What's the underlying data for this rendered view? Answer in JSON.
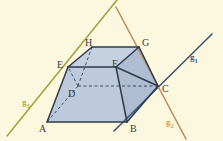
{
  "figure": {
    "name": "geometry-prism-with-three-lines",
    "background_color": "#FBF8DF",
    "width": 223,
    "height": 141
  },
  "solid": {
    "name": "truncated-prism",
    "fill_color": "#BCCADC",
    "edge_color": "#2F3B4C",
    "hidden_edge_color": "#3A4A66",
    "vertices": [
      {
        "id": "A",
        "label": "A",
        "x": 47,
        "y": 122,
        "hidden": false,
        "label_x": 39,
        "label_y": 124
      },
      {
        "id": "B",
        "label": "B",
        "x": 127,
        "y": 122,
        "hidden": false,
        "label_x": 130,
        "label_y": 124
      },
      {
        "id": "C",
        "label": "C",
        "x": 158,
        "y": 86,
        "hidden": false,
        "label_x": 162,
        "label_y": 84
      },
      {
        "id": "D",
        "label": "D",
        "x": 78,
        "y": 86,
        "hidden": true,
        "label_x": 68,
        "label_y": 89
      },
      {
        "id": "E",
        "label": "E",
        "x": 68,
        "y": 67,
        "hidden": false,
        "label_x": 57,
        "label_y": 60
      },
      {
        "id": "F",
        "label": "F",
        "x": 116,
        "y": 67,
        "hidden": false,
        "label_x": 112,
        "label_y": 59
      },
      {
        "id": "G",
        "label": "G",
        "x": 139,
        "y": 47,
        "hidden": false,
        "label_x": 142,
        "label_y": 38
      },
      {
        "id": "H",
        "label": "H",
        "x": 92,
        "y": 47,
        "hidden": false,
        "label_x": 85,
        "label_y": 38
      }
    ],
    "visible_edges": [
      [
        "A",
        "B"
      ],
      [
        "B",
        "C"
      ],
      [
        "C",
        "G"
      ],
      [
        "G",
        "H"
      ],
      [
        "H",
        "E"
      ],
      [
        "E",
        "A"
      ],
      [
        "E",
        "F"
      ],
      [
        "F",
        "G"
      ],
      [
        "F",
        "C"
      ],
      [
        "F",
        "B"
      ]
    ],
    "hidden_edges": [
      [
        "D",
        "A"
      ],
      [
        "D",
        "C"
      ],
      [
        "D",
        "H"
      ],
      [
        "D",
        "E"
      ]
    ]
  },
  "lines": [
    {
      "id": "g1",
      "label": "g",
      "subscript": "1",
      "color": "#3B5878",
      "label_color": "#3B5878",
      "x1": 114,
      "y1": 131,
      "x2": 212,
      "y2": 34,
      "label_x": 190,
      "label_y": 53
    },
    {
      "id": "g2",
      "label": "g",
      "subscript": "2",
      "color": "#C08B5C",
      "label_color": "#E09A4A",
      "x1": 116,
      "y1": 7,
      "x2": 186,
      "y2": 139,
      "label_x": 166,
      "label_y": 118
    },
    {
      "id": "g3",
      "label": "g",
      "subscript": "3",
      "color": "#9FA83C",
      "label_color": "#A8B23E",
      "x1": 7,
      "y1": 136,
      "x2": 117,
      "y2": 0,
      "label_x": 22,
      "label_y": 98
    }
  ]
}
